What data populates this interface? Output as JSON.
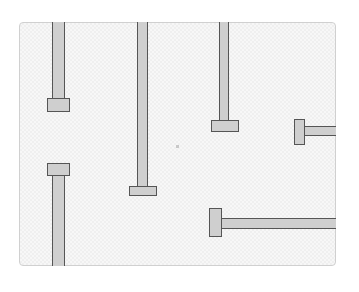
{
  "game": {
    "board": {
      "left": 19,
      "top": 22,
      "width": 317,
      "height": 244
    },
    "pipe_color": "#cfcfcf",
    "outline_color": "#555555",
    "pipes": [
      {
        "id": "pipe-1",
        "orientation": "vertical-down-cap",
        "body": {
          "x": 52,
          "y": 22,
          "w": 13,
          "h": 77
        },
        "cap": {
          "x": 47,
          "y": 98,
          "w": 23,
          "h": 14
        }
      },
      {
        "id": "pipe-2",
        "orientation": "vertical-down-cap",
        "body": {
          "x": 137,
          "y": 22,
          "w": 11,
          "h": 165
        },
        "cap": {
          "x": 129,
          "y": 186,
          "w": 28,
          "h": 10
        }
      },
      {
        "id": "pipe-3",
        "orientation": "vertical-down-cap",
        "body": {
          "x": 219,
          "y": 22,
          "w": 10,
          "h": 99
        },
        "cap": {
          "x": 211,
          "y": 120,
          "w": 28,
          "h": 12
        }
      },
      {
        "id": "pipe-4",
        "orientation": "horizontal-left-cap",
        "body": {
          "x": 304,
          "y": 126,
          "w": 32,
          "h": 10
        },
        "cap": {
          "x": 294,
          "y": 119,
          "w": 11,
          "h": 26
        }
      },
      {
        "id": "pipe-5",
        "orientation": "horizontal-left-cap",
        "body": {
          "x": 221,
          "y": 218,
          "w": 115,
          "h": 11
        },
        "cap": {
          "x": 209,
          "y": 208,
          "w": 13,
          "h": 29
        }
      },
      {
        "id": "pipe-6",
        "orientation": "vertical-up-cap",
        "body": {
          "x": 52,
          "y": 175,
          "w": 13,
          "h": 91
        },
        "cap": {
          "x": 47,
          "y": 163,
          "w": 23,
          "h": 13
        }
      }
    ],
    "center_dot": {
      "x": 176,
      "y": 145
    }
  }
}
